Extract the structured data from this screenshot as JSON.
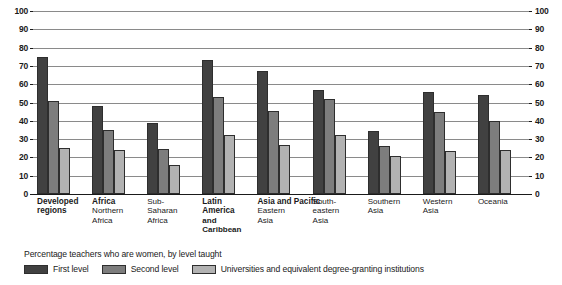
{
  "caption": "Percentage teachers who are women, by level taught",
  "legend": {
    "items": [
      {
        "label": "First level",
        "color": "#414141",
        "name": "first-level"
      },
      {
        "label": "Second level",
        "color": "#7d7d7d",
        "name": "second-level"
      },
      {
        "label": "Universities and equivalent degree-granting institutions",
        "color": "#b2b2b2",
        "name": "universities"
      }
    ]
  },
  "axis": {
    "ticks": [
      "100",
      "90",
      "80",
      "70",
      "60",
      "50",
      "40",
      "30",
      "20",
      "10",
      "0"
    ]
  },
  "groups": [
    {
      "head": "Developed",
      "head2": "regions",
      "sub": "",
      "sub2": "",
      "sub3": "",
      "headBold": true
    },
    {
      "head": "Africa",
      "head2": "",
      "sub": "Northern",
      "sub2": "Africa",
      "sub3": "",
      "headBold": true
    },
    {
      "head": "",
      "head2": "",
      "sub": "Sub-",
      "sub2": "Saharan",
      "sub3": "Africa",
      "headBold": false
    },
    {
      "head": "Latin",
      "head2": "America",
      "sub": "and",
      "sub2": "Caribbean",
      "sub3": "",
      "headBold": true
    },
    {
      "head": "Asia and Pacific",
      "head2": "",
      "sub": "Eastern",
      "sub2": "Asia",
      "sub3": "",
      "headBold": true
    },
    {
      "head": "",
      "head2": "",
      "sub": "South-",
      "sub2": "eastern",
      "sub3": "Asia",
      "headBold": false
    },
    {
      "head": "",
      "head2": "",
      "sub": "Southern",
      "sub2": "Asia",
      "sub3": "",
      "headBold": false
    },
    {
      "head": "",
      "head2": "",
      "sub": "Western",
      "sub2": "Asia",
      "sub3": "",
      "headBold": false
    },
    {
      "head": "",
      "head2": "",
      "sub": "Oceania",
      "sub2": "",
      "sub3": "",
      "headBold": false
    }
  ],
  "chart_data": {
    "type": "bar",
    "title": "",
    "subtitle": "Percentage teachers who are women, by level taught",
    "xlabel": "",
    "ylabel": "",
    "ylim": [
      0,
      100
    ],
    "yticks": [
      0,
      10,
      20,
      30,
      40,
      50,
      60,
      70,
      80,
      90,
      100
    ],
    "grid": "horizontal",
    "legend_position": "bottom-left",
    "dual_axis": true,
    "categories": [
      "Developed regions",
      "Northern Africa",
      "Sub-Saharan Africa",
      "Latin America and Caribbean",
      "Eastern Asia",
      "South-eastern Asia",
      "Southern Asia",
      "Western Asia",
      "Oceania"
    ],
    "series": [
      {
        "name": "First level",
        "color": "#414141",
        "values": [
          75,
          48,
          39,
          73,
          67,
          57,
          34.5,
          55.5,
          54
        ]
      },
      {
        "name": "Second level",
        "color": "#7d7d7d",
        "values": [
          51,
          35,
          24.5,
          53,
          45.5,
          52,
          26,
          45,
          40
        ]
      },
      {
        "name": "Universities and equivalent degree-granting institutions",
        "color": "#b2b2b2",
        "values": [
          25,
          24,
          16,
          32,
          27,
          32,
          21,
          23.5,
          24
        ]
      }
    ]
  }
}
